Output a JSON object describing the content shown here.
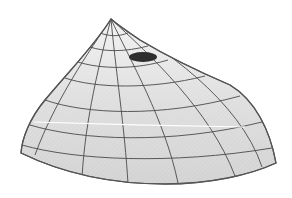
{
  "figure": {
    "colors": {
      "background": "#ffffff",
      "surface_fill": "#dcdcdc",
      "surface_fill_light": "#efefef",
      "grid_line": "#4a4a4a",
      "outline": "#555555",
      "spot": "#2e2e2e",
      "highlight": "#ffffff"
    },
    "apex": [
      111,
      19
    ],
    "spot": {
      "cx": 143,
      "cy": 57,
      "rx": 14,
      "ry": 5
    }
  }
}
